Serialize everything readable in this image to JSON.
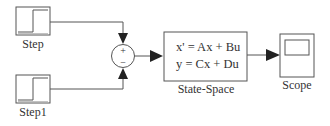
{
  "diagram": {
    "blocks": [
      {
        "id": "step",
        "label": "Step",
        "type": "source"
      },
      {
        "id": "step1",
        "label": "Step1",
        "type": "source"
      },
      {
        "id": "sum",
        "signs": [
          "+",
          "−"
        ],
        "type": "sum"
      },
      {
        "id": "state_space",
        "label": "State-Space",
        "equations": [
          "x' = Ax + Bu",
          "y = Cx + Du"
        ],
        "type": "system"
      },
      {
        "id": "scope",
        "label": "Scope",
        "type": "sink"
      }
    ],
    "connections": [
      {
        "from": "step",
        "to": "sum",
        "sign": "+"
      },
      {
        "from": "step1",
        "to": "sum",
        "sign": "−"
      },
      {
        "from": "sum",
        "to": "state_space"
      },
      {
        "from": "state_space",
        "to": "scope"
      }
    ],
    "colors": {
      "line": "#444444",
      "background": "#ffffff"
    }
  }
}
